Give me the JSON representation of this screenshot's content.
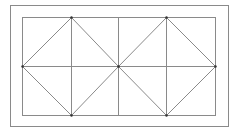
{
  "diagram": {
    "colors": {
      "background": "#ffffff",
      "line": "#8a8a8a",
      "vertex": "#333333"
    },
    "outer_frame": {
      "x": 10,
      "y": 5,
      "width": 218,
      "height": 121
    },
    "inner_rect": {
      "x": 22,
      "y": 17,
      "width": 193,
      "height": 98
    },
    "grid": {
      "vertical_lines_x": [
        71,
        118,
        166
      ],
      "horizontal_line_y": 66
    },
    "diamonds": [
      {
        "name": "left-diamond",
        "points": [
          [
            71,
            17
          ],
          [
            118,
            66
          ],
          [
            71,
            115
          ],
          [
            22,
            66
          ]
        ]
      },
      {
        "name": "right-diamond",
        "points": [
          [
            166,
            17
          ],
          [
            215,
            66
          ],
          [
            166,
            115
          ],
          [
            118,
            66
          ]
        ]
      }
    ],
    "vertices": [
      [
        71,
        17
      ],
      [
        166,
        17
      ],
      [
        22,
        66
      ],
      [
        118,
        66
      ],
      [
        215,
        66
      ],
      [
        71,
        115
      ],
      [
        166,
        115
      ]
    ]
  }
}
